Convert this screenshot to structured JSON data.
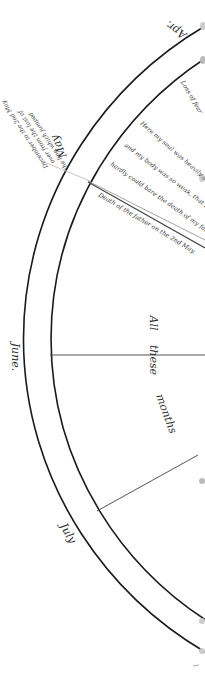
{
  "diagram": {
    "colors": {
      "background": "#ffffff",
      "arc_stroke": "#1a1a1a",
      "divider_stroke": "#555555",
      "faint_line": "#c8c8c8",
      "text": "#3a3a3a"
    },
    "months": [
      {
        "label": "Apr."
      },
      {
        "label": "May"
      },
      {
        "label": "June."
      },
      {
        "label": "July"
      }
    ],
    "inner_notes": [
      {
        "label": "Loss of fear"
      },
      {
        "label": "Here my soul was heavily attack"
      },
      {
        "label": "and my body was so weak, that I"
      },
      {
        "label": "hardly could bare the death of my father."
      },
      {
        "label": "Death of the father on the 2nd May."
      }
    ],
    "side_note": {
      "lines": [
        "the line which jumped",
        "over from the last of",
        "December to the 2nd May."
      ]
    },
    "span_text": {
      "words": [
        "All",
        "these",
        "months"
      ]
    }
  }
}
